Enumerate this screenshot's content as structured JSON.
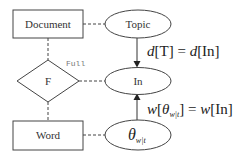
{
  "diagram": {
    "nodes": {
      "document": {
        "label": "Document",
        "shape": "rectangle"
      },
      "topic": {
        "label": "Topic",
        "shape": "ellipse"
      },
      "f": {
        "label": "F",
        "shape": "diamond"
      },
      "in": {
        "label": "In",
        "shape": "ellipse"
      },
      "word": {
        "label": "Word",
        "shape": "rectangle"
      },
      "theta": {
        "label": "θ",
        "subscript": "w|t",
        "shape": "ellipse"
      }
    },
    "relation_label": "Full",
    "equations": {
      "top": {
        "lhs_var": "d",
        "lhs_arg": "[T]",
        "eq": " = ",
        "rhs_var": "d",
        "rhs_arg": "[In]"
      },
      "bottom": {
        "lhs_var": "w",
        "lhs_open": "[",
        "lhs_theta": "θ",
        "lhs_sub": "w|t",
        "lhs_close": "]",
        "eq": " = ",
        "rhs_var": "w",
        "rhs_arg": "[In]"
      }
    },
    "edges": [
      {
        "from": "document",
        "to": "topic",
        "style": "dashed"
      },
      {
        "from": "document",
        "to": "f",
        "style": "dashed"
      },
      {
        "from": "f",
        "to": "in",
        "style": "dashed"
      },
      {
        "from": "f",
        "to": "word",
        "style": "dashed"
      },
      {
        "from": "word",
        "to": "theta",
        "style": "dashed"
      },
      {
        "from": "topic",
        "to": "in",
        "style": "arrow"
      },
      {
        "from": "theta",
        "to": "in",
        "style": "arrow"
      }
    ],
    "colors": {
      "stroke": "#444444",
      "text": "#333333",
      "label_gray": "#777777"
    }
  }
}
